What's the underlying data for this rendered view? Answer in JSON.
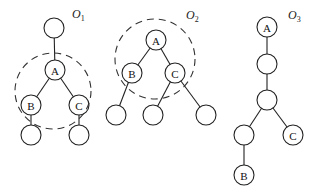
{
  "diagram": {
    "type": "tree-rotation-illustration",
    "node_radius": 10,
    "trees": [
      {
        "id": "O1",
        "label_main": "O",
        "label_sub": "1",
        "label_pos": [
          72,
          18
        ],
        "dashed_circle": {
          "cx": 53,
          "cy": 91,
          "r": 38
        },
        "nodes": [
          {
            "id": "root",
            "label": "",
            "x": 54,
            "y": 28
          },
          {
            "id": "A",
            "label": "A",
            "x": 55,
            "y": 70
          },
          {
            "id": "B",
            "label": "B",
            "x": 31,
            "y": 105
          },
          {
            "id": "C",
            "label": "C",
            "x": 79,
            "y": 105
          },
          {
            "id": "Bc",
            "label": "",
            "x": 31,
            "y": 135
          },
          {
            "id": "Cc",
            "label": "",
            "x": 79,
            "y": 135
          }
        ],
        "edges": [
          [
            "root",
            "A"
          ],
          [
            "A",
            "B"
          ],
          [
            "A",
            "C"
          ],
          [
            "B",
            "Bc"
          ],
          [
            "C",
            "Cc"
          ]
        ]
      },
      {
        "id": "O2",
        "label_main": "O",
        "label_sub": "2",
        "label_pos": [
          186,
          19
        ],
        "dashed_circle": {
          "cx": 155,
          "cy": 59,
          "r": 40
        },
        "nodes": [
          {
            "id": "A",
            "label": "A",
            "x": 156,
            "y": 40
          },
          {
            "id": "B",
            "label": "B",
            "x": 132,
            "y": 73
          },
          {
            "id": "C",
            "label": "C",
            "x": 175,
            "y": 73
          },
          {
            "id": "L1",
            "label": "",
            "x": 116,
            "y": 115
          },
          {
            "id": "L2",
            "label": "",
            "x": 153,
            "y": 115
          },
          {
            "id": "L3",
            "label": "",
            "x": 206,
            "y": 115
          }
        ],
        "edges": [
          [
            "A",
            "B"
          ],
          [
            "A",
            "C"
          ],
          [
            "B",
            "L1"
          ],
          [
            "C",
            "L2"
          ],
          [
            "C",
            "L3"
          ]
        ]
      },
      {
        "id": "O3",
        "label_main": "O",
        "label_sub": "3",
        "label_pos": [
          288,
          19
        ],
        "dashed_circle": null,
        "nodes": [
          {
            "id": "A",
            "label": "A",
            "x": 267,
            "y": 27
          },
          {
            "id": "n2",
            "label": "",
            "x": 267,
            "y": 64
          },
          {
            "id": "n3",
            "label": "",
            "x": 267,
            "y": 100
          },
          {
            "id": "n4",
            "label": "",
            "x": 244,
            "y": 135
          },
          {
            "id": "C",
            "label": "C",
            "x": 293,
            "y": 135
          },
          {
            "id": "B",
            "label": "B",
            "x": 244,
            "y": 175
          }
        ],
        "edges": [
          [
            "A",
            "n2"
          ],
          [
            "n2",
            "n3"
          ],
          [
            "n3",
            "n4"
          ],
          [
            "n3",
            "C"
          ],
          [
            "n4",
            "B"
          ]
        ]
      }
    ]
  }
}
